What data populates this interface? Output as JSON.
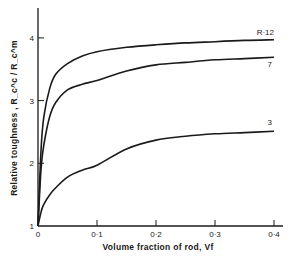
{
  "chart_data": {
    "type": "line",
    "title": "",
    "xlabel": "Volume fraction of rod,  V_f",
    "ylabel": "Relative toughness , R_c^c / R_c^m",
    "xlim": [
      0,
      0.42
    ],
    "ylim": [
      1,
      4.4
    ],
    "xticks": [
      0,
      0.1,
      0.2,
      0.3,
      0.4
    ],
    "xtick_labels": [
      "0",
      "0·1",
      "0·2",
      "0·3",
      "0·4"
    ],
    "yticks": [
      1,
      2,
      3,
      4
    ],
    "ytick_labels": [
      "1",
      "2",
      "3",
      "4"
    ],
    "grid": false,
    "legend": "inline curve labels at right end",
    "series": [
      {
        "name": "R = 12",
        "label": "R·12",
        "x": [
          0,
          0.005,
          0.01,
          0.02,
          0.03,
          0.05,
          0.075,
          0.1,
          0.15,
          0.2,
          0.25,
          0.3,
          0.35,
          0.4
        ],
        "values": [
          1.0,
          2.2,
          2.75,
          3.2,
          3.42,
          3.59,
          3.71,
          3.78,
          3.85,
          3.89,
          3.92,
          3.94,
          3.96,
          3.97
        ]
      },
      {
        "name": "R = 7",
        "label": "7",
        "x": [
          0,
          0.005,
          0.01,
          0.02,
          0.03,
          0.05,
          0.075,
          0.1,
          0.15,
          0.2,
          0.25,
          0.3,
          0.35,
          0.4
        ],
        "values": [
          1.0,
          1.9,
          2.3,
          2.75,
          2.97,
          3.17,
          3.26,
          3.32,
          3.47,
          3.57,
          3.61,
          3.65,
          3.67,
          3.69
        ]
      },
      {
        "name": "R = 3",
        "label": "3",
        "x": [
          0,
          0.005,
          0.01,
          0.02,
          0.03,
          0.05,
          0.075,
          0.1,
          0.15,
          0.2,
          0.25,
          0.3,
          0.35,
          0.4
        ],
        "values": [
          1.0,
          1.22,
          1.35,
          1.5,
          1.61,
          1.78,
          1.89,
          1.97,
          2.23,
          2.37,
          2.43,
          2.47,
          2.49,
          2.51
        ]
      }
    ]
  },
  "colors": {
    "ink": "#1a1a1a",
    "background": "#ffffff"
  }
}
